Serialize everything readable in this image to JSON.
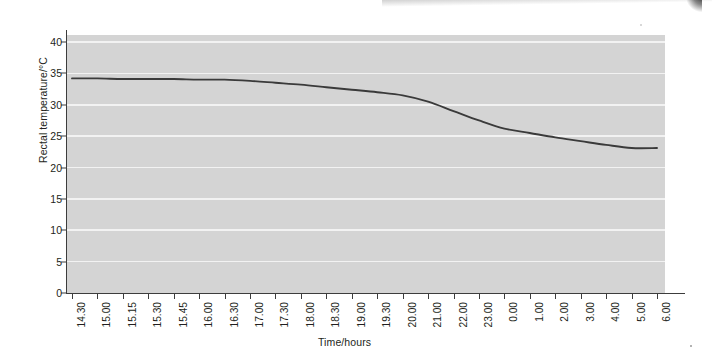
{
  "chart_data": {
    "type": "line",
    "title": "",
    "subtitle": "",
    "xlabel": "Time/hours",
    "ylabel": "Rectal temperature/°C",
    "categories": [
      "14.30",
      "15.00",
      "15.15",
      "15.30",
      "15.45",
      "16.00",
      "16.30",
      "17.00",
      "17.30",
      "18.00",
      "18.30",
      "19.00",
      "19.30",
      "20.00",
      "21.00",
      "22.00",
      "23.00",
      "0.00",
      "1.00",
      "2.00",
      "3.00",
      "4.00",
      "5.00",
      "6.00"
    ],
    "values": [
      34.2,
      34.2,
      34.1,
      34.1,
      34.1,
      34.0,
      34.0,
      33.8,
      33.5,
      33.2,
      32.8,
      32.4,
      32.0,
      31.5,
      30.5,
      29.0,
      27.5,
      26.2,
      25.5,
      24.8,
      24.2,
      23.6,
      23.1,
      23.1
    ],
    "series": [
      {
        "name": "Rectal temperature",
        "values": [
          34.2,
          34.2,
          34.1,
          34.1,
          34.1,
          34.0,
          34.0,
          33.8,
          33.5,
          33.2,
          32.8,
          32.4,
          32.0,
          31.5,
          30.5,
          29.0,
          27.5,
          26.2,
          25.5,
          24.8,
          24.2,
          23.6,
          23.1,
          23.1
        ],
        "color": "#3a3a3a"
      }
    ],
    "y_ticks": [
      0,
      5,
      10,
      15,
      20,
      25,
      30,
      35,
      40
    ],
    "ylim": [
      0,
      40
    ],
    "xlim_index": [
      0,
      23
    ],
    "grid": "horizontal",
    "legend": "none",
    "plot_background": "#d4d4d4",
    "gridline_color": "#f2f2f2",
    "axis_color": "#3c3c3c",
    "line_color": "#3a3a3a",
    "page_background": "#ffffff"
  }
}
